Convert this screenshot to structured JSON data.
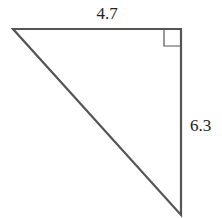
{
  "diagram": {
    "type": "right-triangle",
    "stroke_color": "#555555",
    "label_color": "#222222",
    "sides": {
      "top": {
        "label": "4.7"
      },
      "right": {
        "label": "6.3"
      }
    },
    "right_angle_marker": "top-right"
  }
}
